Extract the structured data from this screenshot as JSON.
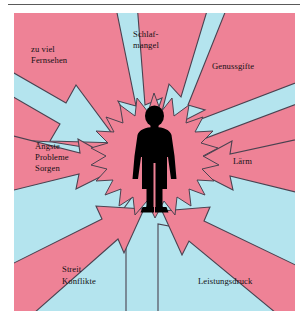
{
  "diagram": {
    "type": "radial-pressure-arrows",
    "title_visible": false,
    "center": {
      "icon": "human-figure-silhouette",
      "burst": "starburst",
      "burst_color": "#EE8296",
      "figure_color": "#000000"
    },
    "colors": {
      "pink": "#EE8296",
      "cyan": "#B4E4EE",
      "outline": "#4a4250",
      "text": "#141014",
      "page": "#ffffff",
      "rule": "#5a5a5a"
    },
    "arrow_count": 8,
    "arrows": [
      {
        "id": "schlafmangel",
        "label": "Schlaf-\nmangel",
        "direction": "from-top",
        "fill": "cyan"
      },
      {
        "id": "genussgifte",
        "label": "Genussgifte",
        "direction": "from-top-right",
        "fill": "cyan"
      },
      {
        "id": "laerm",
        "label": "Lärm",
        "direction": "from-right",
        "fill": "pink"
      },
      {
        "id": "leistungsdruck",
        "label": "Leistungsdruck",
        "direction": "from-bottom-right",
        "fill": "pink"
      },
      {
        "id": "streit",
        "label": "Streit\nKonflikte",
        "direction": "from-bottom-left",
        "fill": "pink"
      },
      {
        "id": "aengste",
        "label": "Ängste\nProbleme\nSorgen",
        "direction": "from-left",
        "fill": "pink"
      },
      {
        "id": "fernsehen",
        "label": "zu viel\nFernsehen",
        "direction": "from-top-left",
        "fill": "cyan"
      },
      {
        "id": "unten",
        "label": "",
        "direction": "from-bottom",
        "fill": "cyan"
      }
    ],
    "labels": {
      "fernsehen_line1": "zu viel",
      "fernsehen_line2": "Fernsehen",
      "schlaf_line1": "Schlaf-",
      "schlaf_line2": "mangel",
      "genussgifte": "Genussgifte",
      "aengste_line1": "Ängste",
      "aengste_line2": "Probleme",
      "aengste_line3": "Sorgen",
      "laerm": "Lärm",
      "streit_line1": "Streit",
      "streit_line2": "Konflikte",
      "leistungsdruck": "Leistungsdruck"
    }
  }
}
